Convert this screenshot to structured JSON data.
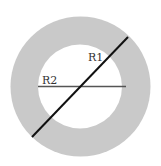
{
  "diagram": {
    "type": "annulus",
    "colors": {
      "ring_fill": "#c9c9c9",
      "inner_fill": "#ffffff",
      "diameter_line": "#111111",
      "radius_line": "#555555",
      "label": "#333333"
    },
    "labels": {
      "outer_radius": "R1",
      "inner_radius": "R2"
    }
  }
}
